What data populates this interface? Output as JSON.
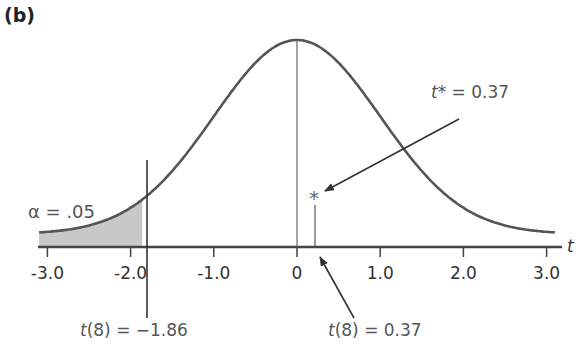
{
  "panel_label": "(b)",
  "axis": {
    "variable_label": "t",
    "ticks": [
      "-3.0",
      "-2.0",
      "-1.0",
      "0",
      "1.0",
      "2.0",
      "3.0"
    ]
  },
  "annotations": {
    "alpha": "α = .05",
    "critical": {
      "prefix": "t",
      "rest": "(8) = −1.86"
    },
    "observed": {
      "prefix": "t",
      "rest": "(8) = 0.37"
    },
    "tstar": {
      "prefix": "t",
      "rest": "* = 0.37"
    },
    "star_marker": "*"
  },
  "colors": {
    "curve": "#555555",
    "shade": "#c8c8c8",
    "axis": "#444444"
  },
  "chart_data": {
    "type": "area",
    "title": "(b)",
    "xlabel": "t",
    "ylabel": "",
    "xlim": [
      -3.2,
      3.2
    ],
    "x_ticks": [
      -3.0,
      -2.0,
      -1.0,
      0,
      1.0,
      2.0,
      3.0
    ],
    "series": [
      {
        "name": "t(8) density",
        "distribution": "Student t",
        "df": 8
      }
    ],
    "shaded_region": {
      "from": -3.2,
      "to": -1.86,
      "label": "α = .05"
    },
    "critical_value": {
      "x": -1.86,
      "label": "t(8) = −1.86"
    },
    "observed_value": {
      "x": 0.37,
      "label": "t(8) = 0.37",
      "marker": "*",
      "marker_label": "t* = 0.37"
    },
    "grid": false,
    "legend": null
  }
}
